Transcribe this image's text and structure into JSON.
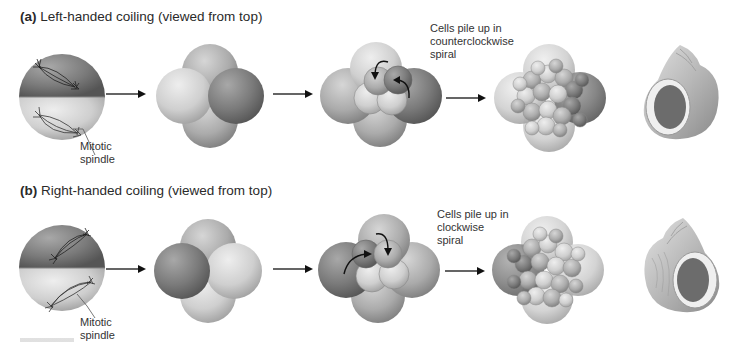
{
  "figure": {
    "panels": [
      {
        "id": "a",
        "letter": "(a)",
        "title": "Left-handed coiling (viewed from top)",
        "spindle_label_line1": "Mitotic",
        "spindle_label_line2": "spindle",
        "spiral_label_line1": "Cells pile up in",
        "spiral_label_line2": "counterclockwise",
        "spiral_label_line3": "spiral",
        "stages": [
          "two-cell-stage",
          "four-cell-stage",
          "eight-cell-stage",
          "morula",
          "sinistral-shell"
        ],
        "arrow_direction": "counterclockwise"
      },
      {
        "id": "b",
        "letter": "(b)",
        "title": "Right-handed coiling (viewed from top)",
        "spindle_label_line1": "Mitotic",
        "spindle_label_line2": "spindle",
        "spiral_label_line1": "Cells pile up in",
        "spiral_label_line2": "clockwise",
        "spiral_label_line3": "spiral",
        "stages": [
          "two-cell-stage",
          "four-cell-stage",
          "eight-cell-stage",
          "morula",
          "dextral-shell"
        ],
        "arrow_direction": "clockwise"
      }
    ],
    "colors": {
      "dark_cell": "#6e6e6e",
      "mid_cell": "#9a9a9a",
      "light_cell": "#c4c4c4",
      "arrow": "#111111",
      "text": "#2a2a2a"
    }
  }
}
